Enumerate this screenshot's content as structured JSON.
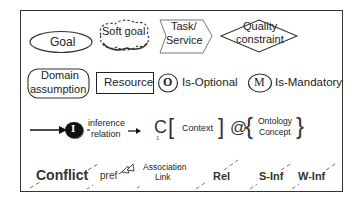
{
  "legend": {
    "row1": {
      "goal": "Goal",
      "soft_goal": "Soft goal",
      "task_line1": "Task/",
      "task_line2": "Service",
      "quality_line1": "Quality",
      "quality_line2": "constraint"
    },
    "row2": {
      "domain_line1": "Domain",
      "domain_line2": "assumption",
      "resource": "Resource",
      "optional_glyph": "O",
      "optional_label": "Is-Optional",
      "mandatory_glyph": "M",
      "mandatory_label": "Is-Mandatory"
    },
    "row3": {
      "inference_glyph": "I",
      "inference_line1": "inference",
      "inference_line2": "relation",
      "context_c": "C",
      "context_sub": "1",
      "context_open": "[",
      "context_label": "Context",
      "context_close": "]",
      "at_symbol": "@",
      "ontology_open": "{",
      "ontology_line1": "Ontology",
      "ontology_line2": "Concept",
      "ontology_close": "}"
    },
    "row4": {
      "conflict": "Conflict",
      "pref": "pref",
      "association_line1": "Association",
      "association_line2": "Link",
      "rel": "Rel",
      "s_inf": "S-Inf",
      "w_inf": "W-Inf"
    }
  }
}
